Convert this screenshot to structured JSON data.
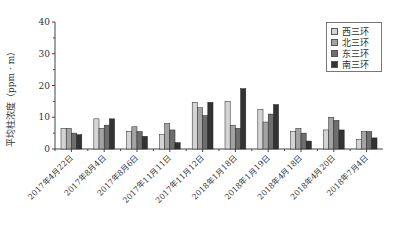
{
  "chart_data": {
    "type": "bar",
    "title": "",
    "xlabel": "",
    "ylabel": "平均柱浓度（ppm · m）",
    "ylim": [
      0,
      40
    ],
    "yticks": [
      0,
      10,
      20,
      30,
      40
    ],
    "grid": false,
    "legend_position": "top-right",
    "categories": [
      "2017年4月22日",
      "2017年8月4日",
      "2017年8月6日",
      "2017年11月11日",
      "2017年11月12日",
      "2018年1月18日",
      "2018年1月19日",
      "2018年4月18日",
      "2018年4月20日",
      "2018年7月4日"
    ],
    "series": [
      {
        "name": "西三环",
        "color": "#d4d4d4",
        "values": [
          6.5,
          9.5,
          5.5,
          4.5,
          14.7,
          15.0,
          12.5,
          5.5,
          6.0,
          3.0
        ]
      },
      {
        "name": "北三环",
        "color": "#a3a3a3",
        "values": [
          6.5,
          6.5,
          7.0,
          8.0,
          13.0,
          7.5,
          8.5,
          6.5,
          10.0,
          5.5
        ]
      },
      {
        "name": "东三环",
        "color": "#6e6e6e",
        "values": [
          5.0,
          7.5,
          5.5,
          6.0,
          10.5,
          6.5,
          11.0,
          5.0,
          9.0,
          5.5
        ]
      },
      {
        "name": "南三环",
        "color": "#333333",
        "values": [
          4.5,
          9.5,
          4.0,
          2.0,
          14.7,
          19.0,
          14.0,
          2.5,
          6.0,
          3.5
        ]
      }
    ]
  }
}
